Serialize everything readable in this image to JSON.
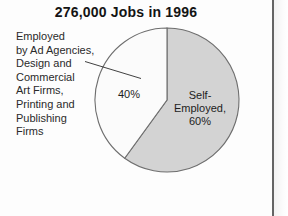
{
  "chart_data": {
    "type": "pie",
    "title": "276,000 Jobs in 1996",
    "categories": [
      "Self-Employed",
      "Employed by Ad Agencies, Design and Commercial Art Firms, Printing and Publishing Firms"
    ],
    "values": [
      60,
      40
    ],
    "value_unit": "percent",
    "total_label": "276,000 Jobs in 1996",
    "legend": "none",
    "grid": false,
    "start_angle_deg": 0,
    "direction": "clockwise",
    "slices": [
      {
        "name": "self-employed",
        "value": 60,
        "value_text": "60%",
        "label_lines": [
          "Self-",
          "Employed,",
          "60%"
        ],
        "color": "#d3d3d3",
        "label_placement": "inside"
      },
      {
        "name": "employed-by-firms",
        "value": 40,
        "value_text": "40%",
        "label_lines": [
          "40%"
        ],
        "color": "#fbfbfb",
        "label_placement": "inside-with-callout"
      }
    ]
  },
  "title": {
    "text": "276,000 Jobs in 1996"
  },
  "left_label": {
    "lines": [
      "Employed",
      "by Ad Agencies,",
      "Design and",
      "Commercial",
      "Art Firms,",
      "Printing and",
      "Publishing",
      "Firms"
    ]
  },
  "slice_labels": {
    "other": {
      "lines": [
        "40%"
      ]
    },
    "self_employed": {
      "lines": [
        "Self-",
        "Employed,",
        "60%"
      ]
    }
  },
  "colors": {
    "slice_self_employed": "#d3d3d3",
    "slice_other": "#fbfbfb",
    "outline": "#6e6e6e",
    "text": "#1d1d1d",
    "title_text": "#141414",
    "page_rule": "#2e2e2e",
    "page_background": "#fdfdfd"
  }
}
